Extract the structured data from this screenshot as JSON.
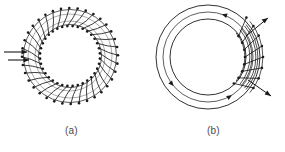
{
  "figure": {
    "background_color": "#ffffff",
    "ink_color": "#1a1a1a",
    "caption_color": "#4a4a4a",
    "panels": [
      {
        "id": "a",
        "caption": "(a)",
        "description": "Toroid uniformly wound with closely spaced turns around the entire core; two horizontal arrows at the left point inward toward the winding.",
        "geometry": {
          "center_x": 70,
          "center_y": 56,
          "outer_radius": 48,
          "inner_radius": 30,
          "turn_count": 36,
          "node_dot_radius": 1.3
        },
        "arrows": [
          {
            "name": "flux-arrow-upper",
            "x1": 4,
            "y1": 52,
            "x2": 27,
            "y2": 52,
            "direction": "right"
          },
          {
            "name": "flux-arrow-lower",
            "x1": 8,
            "y1": 60,
            "x2": 29,
            "y2": 60,
            "direction": "right"
          }
        ]
      },
      {
        "id": "b",
        "caption": "(b)",
        "description": "Toroid with three concentric circular contours and a localized coil section on the right side; field-line arrowheads run counter-clockwise and two diagonal arrows point outward from the winding.",
        "geometry": {
          "center_x": 66,
          "center_y": 57,
          "outer_radius": 52,
          "middle_radius": 45,
          "inner_radius": 38,
          "coil_turn_count": 7,
          "coil_start_angle_deg": -40,
          "coil_end_angle_deg": 40,
          "node_dot_radius": 1.3
        },
        "field_arrowheads": [
          {
            "name": "field-arrowhead-top",
            "angle_deg": -72,
            "direction": "counter-clockwise"
          },
          {
            "name": "field-arrowhead-lower-left",
            "angle_deg": 140,
            "direction": "counter-clockwise"
          },
          {
            "name": "field-arrowhead-bottom-right",
            "angle_deg": 58,
            "direction": "counter-clockwise"
          }
        ],
        "arrows": [
          {
            "name": "lead-arrow-upper-right",
            "x1": 104,
            "y1": 36,
            "x2": 126,
            "y2": 18,
            "direction": "up-right"
          },
          {
            "name": "lead-arrow-lower-right",
            "x1": 106,
            "y1": 80,
            "x2": 129,
            "y2": 96,
            "direction": "down-right"
          }
        ]
      }
    ]
  }
}
